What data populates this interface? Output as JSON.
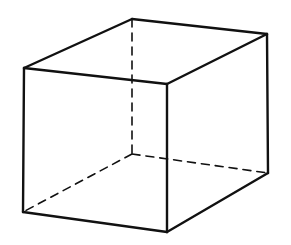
{
  "diagram": {
    "stroke_color": "#111111",
    "background": "#ffffff",
    "vertices": {
      "front_top_left": [
        24,
        68
      ],
      "front_top_right": [
        167,
        84
      ],
      "front_bottom_left": [
        23,
        212
      ],
      "front_bottom_right": [
        167,
        232
      ],
      "back_top_left": [
        132,
        19
      ],
      "back_top_right": [
        267,
        34
      ],
      "back_bottom_left": [
        132,
        154
      ],
      "back_bottom_right": [
        268,
        173
      ]
    },
    "solid_edges": [
      [
        "front_top_left",
        "front_top_right"
      ],
      [
        "front_top_right",
        "front_bottom_right"
      ],
      [
        "front_bottom_right",
        "front_bottom_left"
      ],
      [
        "front_bottom_left",
        "front_top_left"
      ],
      [
        "front_top_left",
        "back_top_left"
      ],
      [
        "back_top_left",
        "back_top_right"
      ],
      [
        "back_top_right",
        "front_top_right"
      ],
      [
        "back_top_right",
        "back_bottom_right"
      ],
      [
        "back_bottom_right",
        "front_bottom_right"
      ]
    ],
    "dashed_edges": [
      [
        "back_top_left",
        "back_bottom_left"
      ],
      [
        "back_bottom_left",
        "front_bottom_left"
      ],
      [
        "back_bottom_left",
        "back_bottom_right"
      ]
    ]
  }
}
